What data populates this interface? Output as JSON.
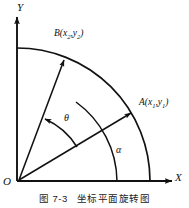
{
  "figure": {
    "caption_number": "图 7-3",
    "caption_title": "坐标平面旋转图",
    "axes": {
      "y_label": "Y",
      "x_label": "X",
      "origin_label": "O"
    },
    "points": [
      {
        "name": "A",
        "label_text": "A(x",
        "sub1": "1",
        "mid": ",y",
        "sub2": "1",
        "close": ")",
        "full": "A(x1,y1)"
      },
      {
        "name": "B",
        "label_text": "B(x",
        "sub1": "2",
        "mid": ",y",
        "sub2": "2",
        "close": ")",
        "full": "B(x2,y2)"
      }
    ],
    "angles": [
      {
        "name": "alpha",
        "symbol": "α",
        "description": "angle from X axis to vector OA"
      },
      {
        "name": "theta",
        "symbol": "θ",
        "description": "rotation angle from vector OA to vector OB"
      }
    ],
    "colors": {
      "stroke": "#111111",
      "background": "#ffffff",
      "text": "#111111"
    }
  }
}
